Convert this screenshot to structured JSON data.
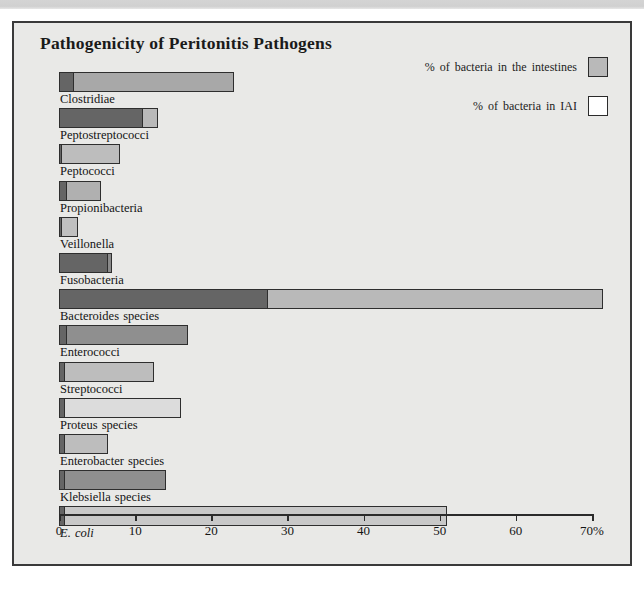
{
  "figure": {
    "title": "Pathogenicity of Peritonitis Pathogens",
    "background_color": "#e9e9e7",
    "border_color": "#3a3a3a"
  },
  "legend": {
    "position": "top-right",
    "entries": [
      {
        "label": "% of bacteria in the intestines",
        "color": "#b9b9b9",
        "swatch": "gray-swatch"
      },
      {
        "label": "% of bacteria in IAI",
        "color": "#ffffff",
        "swatch": "white-swatch"
      }
    ]
  },
  "axis": {
    "min": 0,
    "max": 70,
    "tick_values": [
      0,
      10,
      20,
      30,
      40,
      50,
      60,
      70
    ],
    "tick_labels": [
      "0",
      "10",
      "20",
      "30",
      "40",
      "50",
      "60",
      "70%"
    ],
    "unit": "%"
  },
  "chart_data": {
    "type": "bar",
    "orientation": "horizontal",
    "title": "Pathogenicity of Peritonitis Pathogens",
    "xlabel": "",
    "ylabel": "",
    "xlim": [
      0,
      70
    ],
    "grid": false,
    "legend_position": "top-right",
    "categories": [
      "Clostridiae",
      "Peptostreptococci",
      "Peptococci",
      "Propionibacteria",
      "Veillonella",
      "Fusobacteria",
      "Bacteroides species",
      "Enterococci",
      "Streptococci",
      "Proteus species",
      "Enterobacter species",
      "Klebsiella species",
      "E. coli"
    ],
    "series": [
      {
        "name": "% of bacteria in the intestines",
        "color": "#b9b9b9",
        "values": [
          23.0,
          13.0,
          8.0,
          5.5,
          2.5,
          7.0,
          71.5,
          17.0,
          12.5,
          16.0,
          6.5,
          14.0,
          51.0
        ]
      },
      {
        "name": "% of bacteria in IAI",
        "color": "#656565",
        "values": [
          2.0,
          11.0,
          0.3,
          1.0,
          0.3,
          6.5,
          27.5,
          1.0,
          0.8,
          0.8,
          0.8,
          0.8,
          0.8
        ]
      }
    ]
  },
  "bars": [
    {
      "label": "Clostridiae",
      "intestines": 23.0,
      "iai": 2.0,
      "italic": false,
      "outer_shade": "#a8a8a8"
    },
    {
      "label": "Peptostreptococci",
      "intestines": 13.0,
      "iai": 11.0,
      "italic": false,
      "outer_shade": "#b9b9b9"
    },
    {
      "label": "Peptococci",
      "intestines": 8.0,
      "iai": 0.3,
      "italic": false,
      "outer_shade": "#bdbdbd"
    },
    {
      "label": "Propionibacteria",
      "intestines": 5.5,
      "iai": 1.0,
      "italic": false,
      "outer_shade": "#b0b0b0"
    },
    {
      "label": "Veillonella",
      "intestines": 2.5,
      "iai": 0.3,
      "italic": false,
      "outer_shade": "#c0c0c0"
    },
    {
      "label": "Fusobacteria",
      "intestines": 7.0,
      "iai": 6.5,
      "italic": false,
      "outer_shade": "#8a8a8a"
    },
    {
      "label": "Bacteroides species",
      "intestines": 71.5,
      "iai": 27.5,
      "italic": false,
      "outer_shade": "#b9b9b9"
    },
    {
      "label": "Enterococci",
      "intestines": 17.0,
      "iai": 1.0,
      "italic": false,
      "outer_shade": "#8f8f8f"
    },
    {
      "label": "Streptococci",
      "intestines": 12.5,
      "iai": 0.8,
      "italic": false,
      "outer_shade": "#bdbdbd"
    },
    {
      "label": "Proteus species",
      "intestines": 16.0,
      "iai": 0.8,
      "italic": false,
      "outer_shade": "#dcdcdc"
    },
    {
      "label": "Enterobacter species",
      "intestines": 6.5,
      "iai": 0.8,
      "italic": false,
      "outer_shade": "#bdbdbd"
    },
    {
      "label": "Klebsiella species",
      "intestines": 14.0,
      "iai": 0.8,
      "italic": false,
      "outer_shade": "#8f8f8f"
    },
    {
      "label": "E. coli",
      "intestines": 51.0,
      "iai": 0.8,
      "italic": true,
      "outer_shade": "#c8c8c8"
    }
  ]
}
